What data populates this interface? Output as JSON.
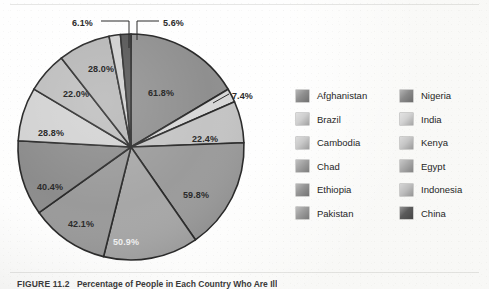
{
  "figure": {
    "caption_number": "FIGURE 11.2",
    "caption_text": "Percentage of People in Each Country Who Are Ill"
  },
  "chart_data": {
    "type": "pie",
    "title": "Percentage of People in Each Country Who Are Ill",
    "xlabel": "",
    "ylabel": "",
    "grid": false,
    "legend_position": "right",
    "legend_columns": 2,
    "value_suffix": "%",
    "categories": [
      "Afghanistan",
      "Nigeria",
      "India",
      "Kenya",
      "Egypt",
      "Indonesia",
      "China",
      "Pakistan",
      "Ethiopia",
      "Chad",
      "Cambodia",
      "Brazil"
    ],
    "values": [
      61.8,
      7.4,
      22.4,
      59.8,
      50.9,
      42.1,
      40.4,
      28.8,
      22.0,
      28.0,
      6.1,
      5.6
    ],
    "labels": [
      "61.8%",
      "7.4%",
      "22.4%",
      "59.8%",
      "50.9%",
      "42.1%",
      "40.4%",
      "28.8%",
      "22.0%",
      "28.0%",
      "6.1%",
      "5.6%"
    ],
    "colors": [
      "#8f8f8f",
      "#d7d7d7",
      "#c4c4c4",
      "#9b9b9b",
      "#a7a7a7",
      "#9a9a9a",
      "#8c8c8c",
      "#d2d2d2",
      "#bdbdbd",
      "#b6b6b6",
      "#cfcfcf",
      "#555555"
    ],
    "slices": [
      {
        "label": "61.8%",
        "value": 61.8,
        "color": "#8f8f8f",
        "leader": false
      },
      {
        "label": "7.4%",
        "value": 7.4,
        "color": "#d7d7d7",
        "leader": true
      },
      {
        "label": "22.4%",
        "value": 22.4,
        "color": "#c4c4c4",
        "leader": false
      },
      {
        "label": "59.8%",
        "value": 59.8,
        "color": "#9b9b9b",
        "leader": false
      },
      {
        "label": "50.9%",
        "value": 50.9,
        "color": "#a7a7a7",
        "leader": false
      },
      {
        "label": "42.1%",
        "value": 42.1,
        "color": "#9a9a9a",
        "leader": false
      },
      {
        "label": "40.4%",
        "value": 40.4,
        "color": "#8c8c8c",
        "leader": false
      },
      {
        "label": "28.8%",
        "value": 28.8,
        "color": "#d2d2d2",
        "leader": false
      },
      {
        "label": "22.0%",
        "value": 22.0,
        "color": "#bdbdbd",
        "leader": false
      },
      {
        "label": "28.0%",
        "value": 28.0,
        "color": "#b6b6b6",
        "leader": false
      },
      {
        "label": "6.1%",
        "value": 6.1,
        "color": "#cfcfcf",
        "leader": true
      },
      {
        "label": "5.6%",
        "value": 5.6,
        "color": "#555555",
        "leader": true
      }
    ]
  },
  "legend": {
    "column_1": [
      {
        "label": "Afghanistan",
        "color": "#8f8f8f"
      },
      {
        "label": "Brazil",
        "color": "#cfcfcf"
      },
      {
        "label": "Cambodia",
        "color": "#c9c9c9"
      },
      {
        "label": "Chad",
        "color": "#a0a0a0"
      },
      {
        "label": "Ethiopia",
        "color": "#949494"
      },
      {
        "label": "Pakistan",
        "color": "#9c9c9c"
      }
    ],
    "column_2": [
      {
        "label": "Nigeria",
        "color": "#8a8a8a"
      },
      {
        "label": "India",
        "color": "#d3d3d3"
      },
      {
        "label": "Kenya",
        "color": "#c6c6c6"
      },
      {
        "label": "Egypt",
        "color": "#a9a9a9"
      },
      {
        "label": "Indonesia",
        "color": "#bfbfbf"
      },
      {
        "label": "China",
        "color": "#5a5a5a"
      }
    ]
  },
  "labels_on_chart": [
    {
      "text": "6.1%",
      "x": 72,
      "y": 18,
      "tone": "dark"
    },
    {
      "text": "5.6%",
      "x": 163,
      "y": 18,
      "tone": "dark"
    },
    {
      "text": "28.0%",
      "x": 88,
      "y": 64,
      "tone": "dark"
    },
    {
      "text": "22.0%",
      "x": 63,
      "y": 89,
      "tone": "dark"
    },
    {
      "text": "28.8%",
      "x": 38,
      "y": 128,
      "tone": "dark"
    },
    {
      "text": "40.4%",
      "x": 37,
      "y": 182,
      "tone": "dark"
    },
    {
      "text": "42.1%",
      "x": 68,
      "y": 219,
      "tone": "dark"
    },
    {
      "text": "50.9%",
      "x": 113,
      "y": 237,
      "tone": "light"
    },
    {
      "text": "59.8%",
      "x": 183,
      "y": 190,
      "tone": "dark"
    },
    {
      "text": "22.4%",
      "x": 192,
      "y": 134,
      "tone": "dark"
    },
    {
      "text": "7.4%",
      "x": 232,
      "y": 91,
      "tone": "dark"
    },
    {
      "text": "61.8%",
      "x": 148,
      "y": 88,
      "tone": "dark"
    }
  ],
  "colors": {
    "page_background": "#f3f3f1",
    "slice_divider": "#2a2a2a",
    "text": "#262626",
    "leader_line": "#2b2b2b"
  }
}
